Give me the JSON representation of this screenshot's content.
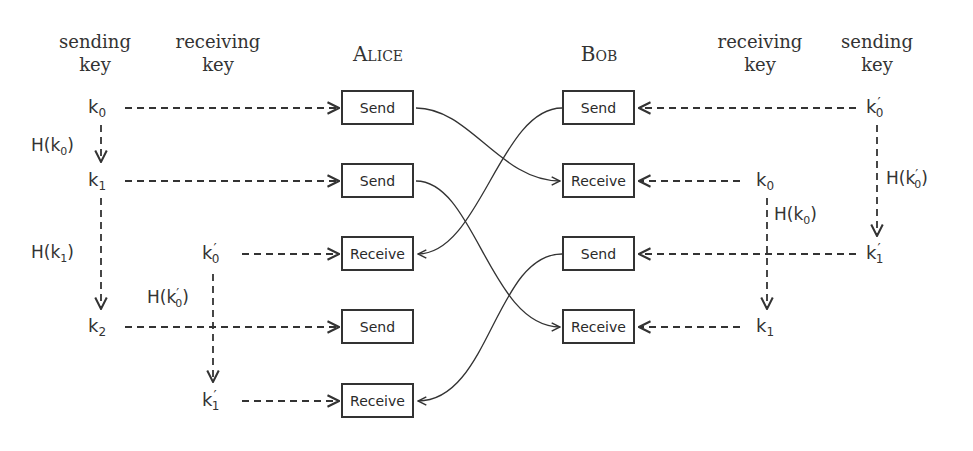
{
  "headers": {
    "alice_sending": [
      "sending",
      "key"
    ],
    "alice_receiving": [
      "receiving",
      "key"
    ],
    "alice": "Alice",
    "bob": "Bob",
    "bob_receiving": [
      "receiving",
      "key"
    ],
    "bob_sending": [
      "sending",
      "key"
    ]
  },
  "alice": {
    "boxes": [
      "Send",
      "Send",
      "Receive",
      "Send",
      "Receive"
    ],
    "sending_keys": [
      {
        "base": "k",
        "sub": "0",
        "prime": ""
      },
      {
        "base": "k",
        "sub": "1",
        "prime": ""
      },
      {
        "base": "k",
        "sub": "2",
        "prime": ""
      }
    ],
    "receiving_keys": [
      {
        "base": "k",
        "sub": "0",
        "prime": "′"
      },
      {
        "base": "k",
        "sub": "1",
        "prime": "′"
      }
    ],
    "hashes": [
      {
        "fn": "H(",
        "base": "k",
        "sub": "0",
        "prime": "",
        "close": ")"
      },
      {
        "fn": "H(",
        "base": "k",
        "sub": "1",
        "prime": "",
        "close": ")"
      },
      {
        "fn": "H(",
        "base": "k",
        "sub": "0",
        "prime": "′",
        "close": ")"
      }
    ]
  },
  "bob": {
    "boxes": [
      "Send",
      "Receive",
      "Send",
      "Receive"
    ],
    "sending_keys": [
      {
        "base": "k",
        "sub": "0",
        "prime": "′"
      },
      {
        "base": "k",
        "sub": "1",
        "prime": "′"
      }
    ],
    "receiving_keys": [
      {
        "base": "k",
        "sub": "0",
        "prime": ""
      },
      {
        "base": "k",
        "sub": "1",
        "prime": ""
      }
    ],
    "hashes": [
      {
        "fn": "H(",
        "base": "k",
        "sub": "0",
        "prime": "′",
        "close": ")"
      },
      {
        "fn": "H(",
        "base": "k",
        "sub": "0",
        "prime": "",
        "close": ")"
      }
    ]
  },
  "colors": {
    "stroke": "#333333",
    "background": "#ffffff"
  }
}
